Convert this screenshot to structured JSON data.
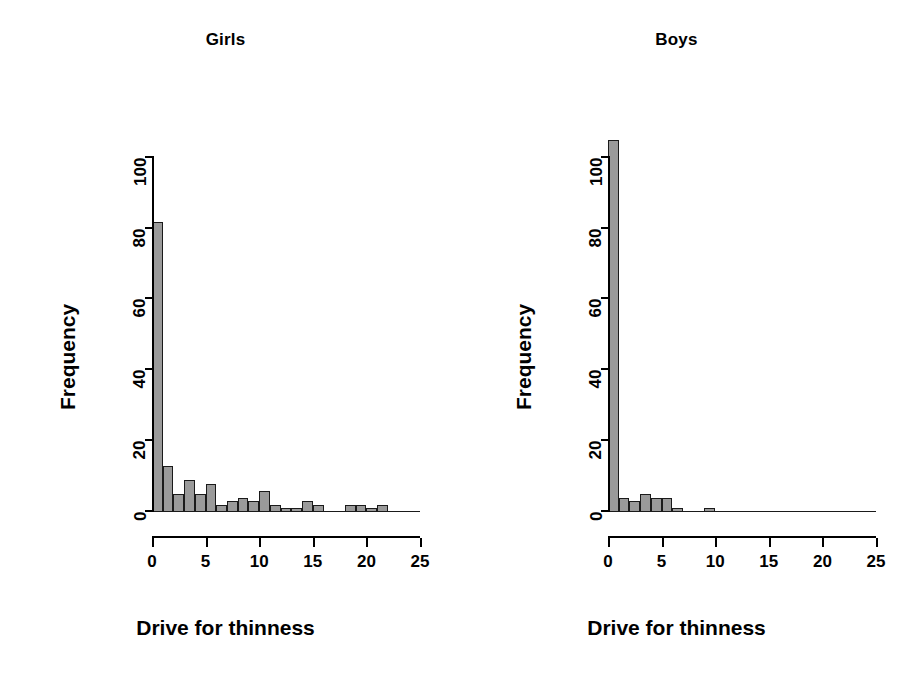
{
  "figure": {
    "background": "#ffffff",
    "bar_fill": "#9a9a9a",
    "bar_border": "#1a1a1a",
    "axis_color": "#000000"
  },
  "panels": [
    {
      "id": "girls",
      "title": "Girls",
      "xlabel": "Drive for thinness",
      "ylabel": "Frequency"
    },
    {
      "id": "boys",
      "title": "Boys",
      "xlabel": "Drive for thinness",
      "ylabel": "Frequency"
    }
  ],
  "chart_data": [
    {
      "type": "bar",
      "title": "Girls",
      "xlabel": "Drive for thinness",
      "ylabel": "Frequency",
      "xlim": [
        0,
        25
      ],
      "ylim": [
        0,
        105
      ],
      "xticks": [
        0,
        5,
        10,
        15,
        20,
        25
      ],
      "yticks": [
        0,
        20,
        40,
        60,
        80,
        100
      ],
      "grid": false,
      "legend": "none",
      "bin_width": 1,
      "bin_starts": [
        0,
        1,
        2,
        3,
        4,
        5,
        6,
        7,
        8,
        9,
        10,
        11,
        12,
        13,
        14,
        15,
        16,
        17,
        18,
        19,
        20,
        21,
        22,
        23,
        24
      ],
      "categories": [
        "0-1",
        "1-2",
        "2-3",
        "3-4",
        "4-5",
        "5-6",
        "6-7",
        "7-8",
        "8-9",
        "9-10",
        "10-11",
        "11-12",
        "12-13",
        "13-14",
        "14-15",
        "15-16",
        "16-17",
        "17-18",
        "18-19",
        "19-20",
        "20-21",
        "21-22",
        "22-23",
        "23-24",
        "24-25"
      ],
      "values": [
        82,
        13,
        5,
        9,
        5,
        8,
        2,
        3,
        4,
        3,
        6,
        2,
        1,
        1,
        3,
        2,
        0,
        0,
        2,
        2,
        1,
        2,
        0,
        0,
        0
      ]
    },
    {
      "type": "bar",
      "title": "Boys",
      "xlabel": "Drive for thinness",
      "ylabel": "Frequency",
      "xlim": [
        0,
        25
      ],
      "ylim": [
        0,
        105
      ],
      "xticks": [
        0,
        5,
        10,
        15,
        20,
        25
      ],
      "yticks": [
        0,
        20,
        40,
        60,
        80,
        100
      ],
      "grid": false,
      "legend": "none",
      "bin_width": 1,
      "bin_starts": [
        0,
        1,
        2,
        3,
        4,
        5,
        6,
        7,
        8,
        9,
        10,
        11,
        12,
        13,
        14,
        15,
        16,
        17,
        18,
        19,
        20,
        21,
        22,
        23,
        24
      ],
      "categories": [
        "0-1",
        "1-2",
        "2-3",
        "3-4",
        "4-5",
        "5-6",
        "6-7",
        "7-8",
        "8-9",
        "9-10",
        "10-11",
        "11-12",
        "12-13",
        "13-14",
        "14-15",
        "15-16",
        "16-17",
        "17-18",
        "18-19",
        "19-20",
        "20-21",
        "21-22",
        "22-23",
        "23-24",
        "24-25"
      ],
      "values": [
        105,
        4,
        3,
        5,
        4,
        4,
        1,
        0,
        0,
        1,
        0,
        0,
        0,
        0,
        0,
        0,
        0,
        0,
        0,
        0,
        0,
        0,
        0,
        0,
        0
      ]
    }
  ]
}
